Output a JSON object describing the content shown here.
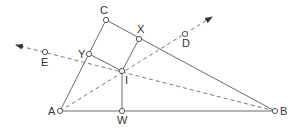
{
  "diagram": {
    "colors": {
      "line": "#6b6b6b",
      "dashed": "#7a7a7a",
      "point_fill": "#ffffff",
      "label": "#333333"
    },
    "points": {
      "A": {
        "label": "A",
        "x": 60,
        "y": 111,
        "lx": 48,
        "ly": 115
      },
      "B": {
        "label": "B",
        "x": 275,
        "y": 111,
        "lx": 280,
        "ly": 115
      },
      "C": {
        "label": "C",
        "x": 106,
        "y": 20,
        "lx": 100,
        "ly": 14
      },
      "X": {
        "label": "X",
        "x": 139,
        "y": 39,
        "lx": 137,
        "ly": 33
      },
      "Y": {
        "label": "Y",
        "x": 89,
        "y": 54,
        "lx": 78,
        "ly": 58
      },
      "I": {
        "label": "I",
        "x": 122,
        "y": 71,
        "lx": 125,
        "ly": 84
      },
      "W": {
        "label": "W",
        "x": 122,
        "y": 111,
        "lx": 117,
        "ly": 124
      },
      "D": {
        "label": "D",
        "x": 185,
        "y": 34,
        "lx": 182,
        "ly": 47
      },
      "E": {
        "label": "E",
        "x": 45,
        "y": 52,
        "lx": 41,
        "ly": 66
      }
    },
    "solid_segments": [
      [
        "A",
        "C"
      ],
      [
        "C",
        "B"
      ],
      [
        "A",
        "B"
      ],
      [
        "X",
        "I"
      ],
      [
        "Y",
        "I"
      ],
      [
        "I",
        "W"
      ]
    ],
    "dashed_rays": [
      {
        "from": "A",
        "through": "I",
        "to": [
          212,
          17
        ],
        "arrow": true
      },
      {
        "from": "B",
        "through": "I",
        "to": [
          16,
          45
        ],
        "arrow": true
      }
    ]
  }
}
